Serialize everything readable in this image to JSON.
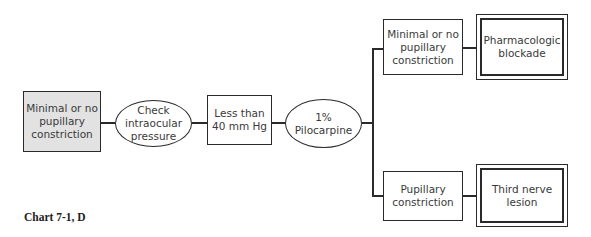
{
  "diagram": {
    "nodes": [
      {
        "id": "start",
        "shape": "rect-shaded",
        "label": "Minimal or no\npupillary\nconstriction"
      },
      {
        "id": "check-iop",
        "shape": "ellipse",
        "label": "Check\nintraocular\npressure"
      },
      {
        "id": "iop-result",
        "shape": "rect",
        "label": "Less than\n40 mm Hg"
      },
      {
        "id": "pilocarpine",
        "shape": "ellipse",
        "label": "1%\nPilocarpine"
      },
      {
        "id": "minimal-constriction",
        "shape": "rect",
        "label": "Minimal or no\npupillary\nconstriction"
      },
      {
        "id": "pharmacologic-blockade",
        "shape": "double-rect",
        "label": "Pharmacologic\nblockade"
      },
      {
        "id": "pupillary-constriction",
        "shape": "rect",
        "label": "Pupillary\nconstriction"
      },
      {
        "id": "third-nerve-lesion",
        "shape": "double-rect",
        "label": "Third nerve\nlesion"
      }
    ],
    "edges": [
      [
        "start",
        "check-iop"
      ],
      [
        "check-iop",
        "iop-result"
      ],
      [
        "iop-result",
        "pilocarpine"
      ],
      [
        "pilocarpine",
        "minimal-constriction"
      ],
      [
        "pilocarpine",
        "pupillary-constriction"
      ],
      [
        "minimal-constriction",
        "pharmacologic-blockade"
      ],
      [
        "pupillary-constriction",
        "third-nerve-lesion"
      ]
    ]
  },
  "caption": "Chart 7-1, D"
}
